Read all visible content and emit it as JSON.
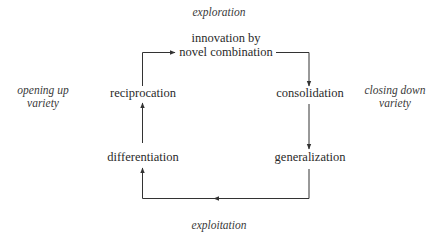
{
  "diagram": {
    "axes": {
      "top": "exploration",
      "bottom": "exploitation",
      "left_line1": "opening up",
      "left_line2": "variety",
      "right_line1": "closing down",
      "right_line2": "variety"
    },
    "nodes": {
      "innovation_line1": "innovation by",
      "innovation_line2": "novel combination",
      "consolidation": "consolidation",
      "generalization": "generalization",
      "differentiation": "differentiation",
      "reciprocation": "reciprocation"
    },
    "cycle_order": [
      "innovation by novel combination",
      "consolidation",
      "generalization",
      "differentiation",
      "reciprocation"
    ],
    "colors": {
      "text": "#2a2a2a",
      "arrows": "#333333",
      "background": "#ffffff"
    }
  }
}
